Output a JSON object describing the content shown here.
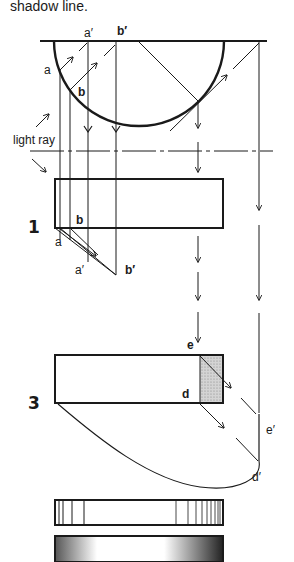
{
  "caption": "shadow line.",
  "labels": {
    "a_prime_top": "a′",
    "b_prime_top": "b′",
    "a_top": "a",
    "b_top": "b",
    "light_ray": "light ray",
    "fig1_number": "1",
    "fig1_b": "b",
    "fig1_a": "a",
    "fig1_a_prime": "a′",
    "fig1_b_prime": "b′",
    "fig3_number": "3",
    "fig3_e": "e",
    "fig3_d": "d",
    "fig3_e_prime": "e′",
    "fig3_d_prime": "d′"
  },
  "colors": {
    "ink": "#1a1a1a",
    "shade": "#c8c8c8",
    "background": "#ffffff"
  },
  "figures": [
    {
      "id": "plan-semicircle",
      "description": "Half-cylinder plan with light rays projecting shadow points"
    },
    {
      "id": "figure-1",
      "description": "Elevation with shadow cast below (a, a′, b, b′)"
    },
    {
      "id": "figure-3",
      "description": "Elevation with shaded face and curved shadow (d, e, d′, e′)"
    },
    {
      "id": "line-shading-bar",
      "description": "Cylinder rendered with line hatching"
    },
    {
      "id": "stipple-shading-bar",
      "description": "Cylinder rendered with stipple shading"
    }
  ]
}
